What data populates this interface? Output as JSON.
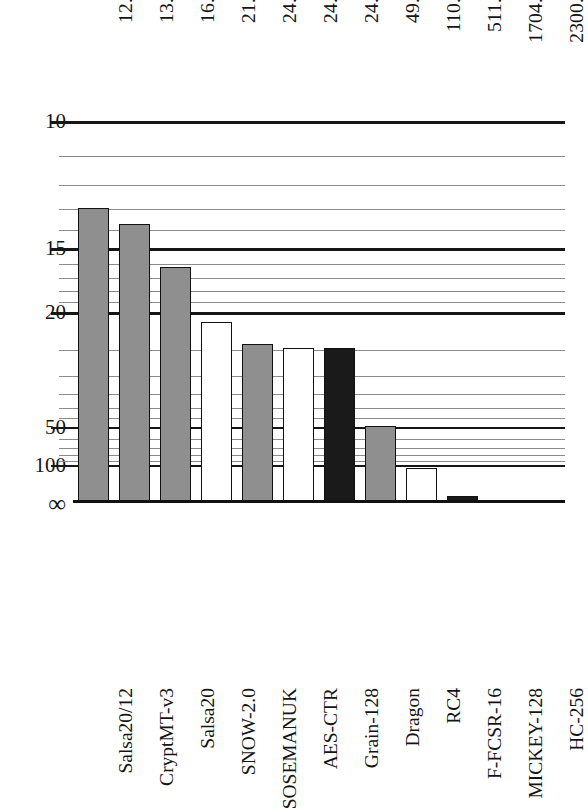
{
  "chart_data": {
    "type": "bar",
    "title": "",
    "subtitle": "",
    "xlabel": "",
    "ylabel": "",
    "orientation": "vertical",
    "grid": true,
    "legend": null,
    "axis_note": "y-axis is inverted and reciprocal (1/x): 10 at top, infinity at the baseline",
    "yaxis_ticks_major": [
      "10",
      "15",
      "20",
      "50",
      "100",
      "∞"
    ],
    "yaxis_ticks_minor": [
      "11",
      "12",
      "13",
      "14",
      "16",
      "17",
      "18",
      "19",
      "25",
      "30",
      "35",
      "40",
      "45",
      "60",
      "70",
      "80",
      "90"
    ],
    "ylim": [
      10,
      null
    ],
    "categories": [
      "Salsa20/12",
      "CryptMT-v3",
      "Salsa20",
      "SNOW-2.0",
      "SOSEMANUK",
      "AES-CTR",
      "Grain-128",
      "Dragon",
      "RC4",
      "F-FCSR-16",
      "MICKEY-128",
      "HC-256"
    ],
    "values": [
      12.96,
      13.69,
      16.17,
      21.1,
      24.07,
      24.66,
      24.69,
      49.54,
      110.61,
      511.28,
      1704.76,
      2300.9
    ],
    "value_labels": [
      "12.96",
      "13.69",
      "16.17",
      "21.10",
      "24.07",
      "24.66",
      "24.69",
      "49.54",
      "110.61",
      "511.28",
      "1704.76",
      "2300.90"
    ],
    "bar_fills": [
      "gray",
      "gray",
      "gray",
      "white",
      "gray",
      "white",
      "black",
      "gray",
      "white",
      "black",
      "black",
      "black"
    ],
    "colors": {
      "gray": "#8f8f8f",
      "white": "#ffffff",
      "black": "#1a1a1a",
      "gridline_minor": "#8a8a8a",
      "gridline_major": "#161616",
      "text": "#141414"
    }
  }
}
